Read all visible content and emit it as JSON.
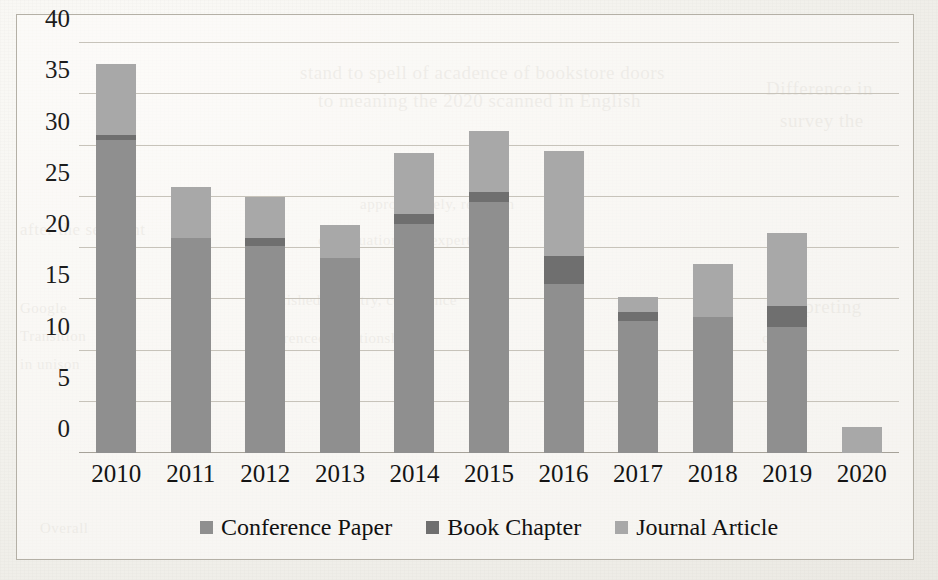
{
  "chart_data": {
    "type": "bar",
    "subtype": "stacked-bar",
    "title": "",
    "xlabel": "",
    "ylabel": "",
    "categories": [
      "2010",
      "2011",
      "2012",
      "2013",
      "2014",
      "2015",
      "2016",
      "2017",
      "2018",
      "2019",
      "2020"
    ],
    "series": [
      {
        "name": "Conference Paper",
        "color": "#8f8f8f",
        "values": [
          30.5,
          21.0,
          20.2,
          19.0,
          22.3,
          24.5,
          16.5,
          12.9,
          13.3,
          12.3,
          0.0
        ]
      },
      {
        "name": "Book Chapter",
        "color": "#6f6f6f",
        "values": [
          0.5,
          0.0,
          0.8,
          0.0,
          1.0,
          1.0,
          2.7,
          0.9,
          0.0,
          2.0,
          0.0
        ]
      },
      {
        "name": "Journal Article",
        "color": "#a8a8a8",
        "values": [
          7.0,
          5.0,
          4.0,
          3.2,
          6.0,
          5.9,
          10.3,
          1.4,
          5.1,
          7.2,
          2.5
        ]
      }
    ],
    "totals": [
      38.0,
      26.0,
      25.0,
      22.2,
      29.3,
      31.4,
      29.5,
      15.2,
      18.4,
      21.5,
      2.5
    ],
    "ylim": [
      0,
      40
    ],
    "yticks": [
      "0",
      "5",
      "10",
      "15",
      "20",
      "25",
      "30",
      "35",
      "40"
    ],
    "ytick_values": [
      0,
      5,
      10,
      15,
      20,
      25,
      30,
      35,
      40
    ],
    "grid": true,
    "legend_position": "bottom"
  },
  "legend": {
    "items": [
      {
        "label": "Conference Paper",
        "key": "conference"
      },
      {
        "label": "Book Chapter",
        "key": "book"
      },
      {
        "label": "Journal Article",
        "key": "journal"
      }
    ]
  },
  "background_bleed": [
    {
      "text": "stand to spell of acadence of bookstore doors",
      "x": 300,
      "y": 62,
      "size": 19
    },
    {
      "text": "to meaning the 2020 scanned in English",
      "x": 318,
      "y": 90,
      "size": 19
    },
    {
      "text": "approximately, research",
      "x": 360,
      "y": 196,
      "size": 15
    },
    {
      "text": "continuation and expert",
      "x": 318,
      "y": 232,
      "size": 15
    },
    {
      "text": "published, country, conference",
      "x": 258,
      "y": 292,
      "size": 15
    },
    {
      "text": "referenced, relationship",
      "x": 258,
      "y": 330,
      "size": 15
    },
    {
      "text": "Overall",
      "x": 40,
      "y": 520,
      "size": 15
    },
    {
      "text": "Difference in",
      "x": 766,
      "y": 78,
      "size": 19
    },
    {
      "text": "survey the",
      "x": 780,
      "y": 110,
      "size": 19
    },
    {
      "text": "after the segment",
      "x": 20,
      "y": 220,
      "size": 17
    },
    {
      "text": "Google",
      "x": 20,
      "y": 300,
      "size": 15
    },
    {
      "text": "Transition",
      "x": 20,
      "y": 328,
      "size": 15
    },
    {
      "text": "in unison",
      "x": 20,
      "y": 356,
      "size": 15
    },
    {
      "text": "Interpreting",
      "x": 766,
      "y": 296,
      "size": 19
    },
    {
      "text": "of the",
      "x": 762,
      "y": 330,
      "size": 15
    }
  ]
}
